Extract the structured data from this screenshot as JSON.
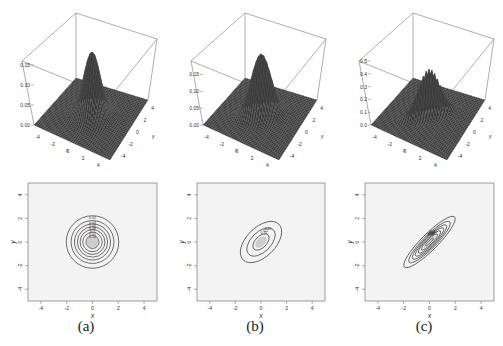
{
  "chart_data": [
    {
      "type": "surface3d",
      "panel": "(a)",
      "title": "",
      "xlabel": "x",
      "ylabel": "y",
      "zlabel": "",
      "x_ticks": [
        "-4",
        "-2",
        "0",
        "2",
        "4"
      ],
      "y_ticks": [
        "-4",
        "-2",
        "0",
        "2",
        "4"
      ],
      "z_ticks": [
        "0.00",
        "0.05",
        "0.10",
        "0.15"
      ],
      "zlim": [
        0,
        0.16
      ],
      "distribution": {
        "mean": [
          0,
          0
        ],
        "sigma_x": 1,
        "sigma_y": 1,
        "rho": 0
      },
      "peak": 0.159
    },
    {
      "type": "surface3d",
      "panel": "(b)",
      "xlabel": "x",
      "ylabel": "y",
      "x_ticks": [
        "-4",
        "-2",
        "0",
        "2",
        "4"
      ],
      "y_ticks": [
        "-4",
        "-2",
        "0",
        "2",
        "4"
      ],
      "z_ticks": [
        "0.00",
        "0.05",
        "0.10",
        "0.15"
      ],
      "zlim": [
        0,
        0.19
      ],
      "distribution": {
        "mean": [
          0,
          0
        ],
        "sigma_x": 1,
        "sigma_y": 1,
        "rho": 0.5
      },
      "peak": 0.184
    },
    {
      "type": "surface3d",
      "panel": "(c)",
      "xlabel": "x",
      "ylabel": "y",
      "x_ticks": [
        "-4",
        "-2",
        "0",
        "2",
        "4"
      ],
      "y_ticks": [
        "-4",
        "-2",
        "0",
        "2",
        "4"
      ],
      "z_ticks": [
        "0.0",
        "0.1",
        "0.2",
        "0.3",
        "0.4",
        "0.5"
      ],
      "zlim": [
        0,
        0.5
      ],
      "distribution": {
        "mean": [
          0,
          0
        ],
        "sigma_x": 1,
        "sigma_y": 1,
        "rho": 0.9
      },
      "peak": 0.365
    },
    {
      "type": "contour",
      "panel": "(a)",
      "xlabel": "x",
      "ylabel": "y",
      "xlim": [
        -5,
        5
      ],
      "ylim": [
        -5,
        5
      ],
      "x_ticks": [
        "-4",
        "-2",
        "0",
        "2",
        "4"
      ],
      "y_ticks": [
        "-4",
        "-2",
        "0",
        "2",
        "4"
      ],
      "levels": [
        0.02,
        0.04,
        0.06,
        0.08,
        0.1,
        0.12,
        0.14
      ],
      "level_labels": [
        "0.02",
        "0.04",
        "0.06",
        "0.08",
        "0.1",
        "0.12",
        "0.14"
      ]
    },
    {
      "type": "contour",
      "panel": "(b)",
      "xlabel": "x",
      "ylabel": "y",
      "xlim": [
        -5,
        5
      ],
      "ylim": [
        -5,
        5
      ],
      "x_ticks": [
        "-4",
        "-2",
        "0",
        "2",
        "4"
      ],
      "y_ticks": [
        "-4",
        "-2",
        "0",
        "2",
        "4"
      ],
      "levels": [
        0.05,
        0.1,
        0.15
      ],
      "level_labels": [
        "0.05",
        "0.1",
        "0.15"
      ]
    },
    {
      "type": "contour",
      "panel": "(c)",
      "xlabel": "x",
      "ylabel": "y",
      "xlim": [
        -5,
        5
      ],
      "ylim": [
        -5,
        5
      ],
      "x_ticks": [
        "-4",
        "-2",
        "0",
        "2",
        "4"
      ],
      "y_ticks": [
        "-4",
        "-2",
        "0",
        "2",
        "4"
      ],
      "levels": [
        0.05,
        0.1,
        0.15,
        0.2,
        0.25,
        0.3,
        0.35
      ],
      "level_labels": [
        "0.05",
        "0.1",
        "0.15",
        "0.2",
        "0.25",
        "0.3",
        "0.35"
      ]
    }
  ],
  "captions": [
    "(a)",
    "(b)",
    "(c)"
  ],
  "colors": {
    "surface": "#3a3a3a",
    "mesh": "#555555",
    "contour": "#333333",
    "panel_bg": "#f3f3f3",
    "frame": "#777777"
  }
}
